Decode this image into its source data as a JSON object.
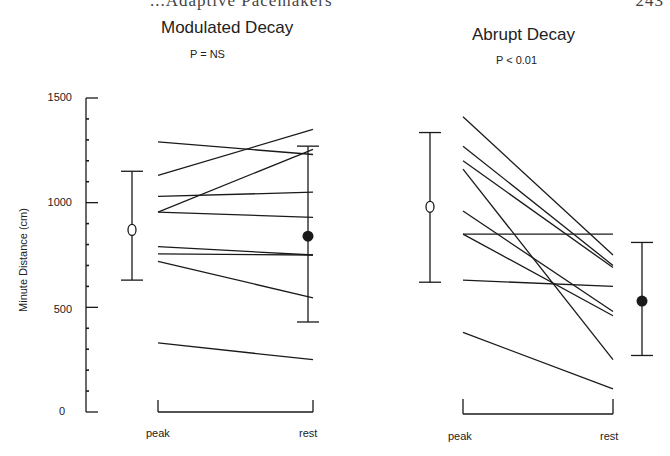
{
  "header": {
    "running_text": "...Adaptive Pacemakers",
    "page_number": "243"
  },
  "chart_data": [
    {
      "type": "line",
      "title": "Modulated Decay",
      "annotation": "P = NS",
      "xlabel": "",
      "ylabel": "Minute Distance (cm)",
      "categories": [
        "peak",
        "rest"
      ],
      "ylim": [
        0,
        1500
      ],
      "yticks": [
        0,
        500,
        1000,
        1500
      ],
      "minor_tick_step": 100,
      "grid": false,
      "series": [
        {
          "name": "subject-1",
          "values": [
            1290,
            1230
          ]
        },
        {
          "name": "subject-2",
          "values": [
            1130,
            1350
          ]
        },
        {
          "name": "subject-3",
          "values": [
            1030,
            1050
          ]
        },
        {
          "name": "subject-4",
          "values": [
            955,
            1255
          ]
        },
        {
          "name": "subject-5",
          "values": [
            955,
            930
          ]
        },
        {
          "name": "subject-6",
          "values": [
            790,
            750
          ]
        },
        {
          "name": "subject-7",
          "values": [
            755,
            750
          ]
        },
        {
          "name": "subject-8",
          "values": [
            720,
            545
          ]
        },
        {
          "name": "subject-9",
          "values": [
            330,
            250
          ]
        }
      ],
      "summary": {
        "peak": {
          "mean": 870,
          "upper": 1150,
          "lower": 630,
          "marker": "open-circle"
        },
        "rest": {
          "mean": 840,
          "upper": 1270,
          "lower": 430,
          "marker": "filled-circle"
        }
      }
    },
    {
      "type": "line",
      "title": "Abrupt Decay",
      "annotation": "P < 0.01",
      "xlabel": "",
      "ylabel": "",
      "categories": [
        "peak",
        "rest"
      ],
      "ylim": [
        0,
        1500
      ],
      "grid": false,
      "series": [
        {
          "name": "subject-1",
          "values": [
            1410,
            750
          ]
        },
        {
          "name": "subject-2",
          "values": [
            1270,
            700
          ]
        },
        {
          "name": "subject-3",
          "values": [
            1200,
            690
          ]
        },
        {
          "name": "subject-4",
          "values": [
            1160,
            250
          ]
        },
        {
          "name": "subject-5",
          "values": [
            960,
            480
          ]
        },
        {
          "name": "subject-6",
          "values": [
            850,
            850
          ]
        },
        {
          "name": "subject-7",
          "values": [
            850,
            460
          ]
        },
        {
          "name": "subject-8",
          "values": [
            630,
            600
          ]
        },
        {
          "name": "subject-9",
          "values": [
            380,
            110
          ]
        }
      ],
      "summary": {
        "peak": {
          "mean": 980,
          "upper": 1335,
          "lower": 620,
          "marker": "open-circle"
        },
        "rest": {
          "mean": 530,
          "upper": 810,
          "lower": 270,
          "marker": "filled-circle"
        }
      }
    }
  ],
  "labels": {
    "panel1_title": "Modulated Decay",
    "panel1_p": "P = NS",
    "panel2_title": "Abrupt Decay",
    "panel2_p": "P < 0.01",
    "ylabel": "Minute Distance (cm)",
    "ytick_1500": "1500",
    "ytick_1000": "1000",
    "ytick_500": "500",
    "ytick_0": "0",
    "x_peak": "peak",
    "x_rest": "rest"
  },
  "colors": {
    "ink": "#1a1a1a",
    "background": "#ffffff"
  }
}
